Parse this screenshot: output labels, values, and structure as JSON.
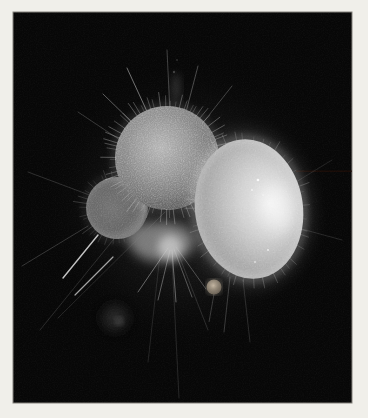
{
  "image": {
    "kind": "darkfield micrograph photograph",
    "subject": "Translucent spherical planktonic organism (foraminifera-like) with three glowing globular chambers, a fuzzy lower chamber and long thin radiating spines",
    "background": "black field",
    "frame": "pale off-white photo border"
  },
  "palette": {
    "frame": "#f0efea",
    "frame_edge": "#84827c",
    "field": "#070707",
    "halo": "#1c1c1c",
    "chamber_top_gray": "#9a9a9a",
    "chamber_right_bright": "#efefef",
    "chamber_left_dim": "#6e6e6e",
    "lower_cloud": "#a8a8a8",
    "rim_glow": "#ffffff",
    "spine": "#d8d8d8",
    "artifact_line": "#220e08",
    "debris": "#2a2a2a",
    "knob_warm": "#b3a28e"
  },
  "scene": {
    "chambers": [
      {
        "name": "upper-textured-chamber",
        "appearance": "finely spiculed mid-gray sphere with hairy rim"
      },
      {
        "name": "right-large-chamber",
        "appearance": "large bright ovoid chamber, brightest toward its right side, glowing rim"
      },
      {
        "name": "left-small-chamber",
        "appearance": "small dim edge-lit sphere on the left"
      },
      {
        "name": "lower-cloudy-chamber",
        "appearance": "bright fuzzy mass at the base of the cluster"
      }
    ],
    "features": [
      "needle-like spines radiating in all directions",
      "two bright parallel spine segments toward lower-left",
      "faint vertical spines reaching the bottom of the frame",
      "small knob protruding below the right chamber",
      "very faint debris blob at lower-left",
      "thin dark scan-line artifact at mid-height near the right edge"
    ]
  }
}
